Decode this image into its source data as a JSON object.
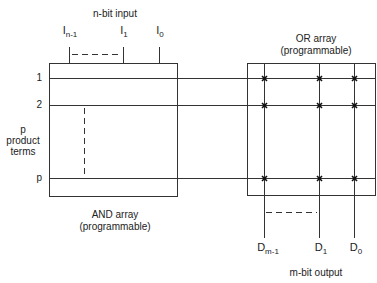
{
  "diagram": {
    "type": "PLA block diagram",
    "input": {
      "title": "n-bit input",
      "signals": [
        {
          "base": "I",
          "sub": "n-1"
        },
        {
          "base": "I",
          "sub": "1"
        },
        {
          "base": "I",
          "sub": "0"
        }
      ]
    },
    "and_array": {
      "title": "AND array",
      "subtitle": "(programmable)"
    },
    "product_terms": {
      "label_lines": [
        "p",
        "product",
        "terms"
      ],
      "rows": [
        "1",
        "2",
        "p"
      ]
    },
    "or_array": {
      "title": "OR array",
      "subtitle": "(programmable)"
    },
    "output": {
      "title": "m-bit output",
      "signals": [
        {
          "base": "D",
          "sub": "m-1"
        },
        {
          "base": "D",
          "sub": "1"
        },
        {
          "base": "D",
          "sub": "0"
        }
      ]
    },
    "colors": {
      "line": "#333333",
      "background": "#ffffff"
    }
  }
}
